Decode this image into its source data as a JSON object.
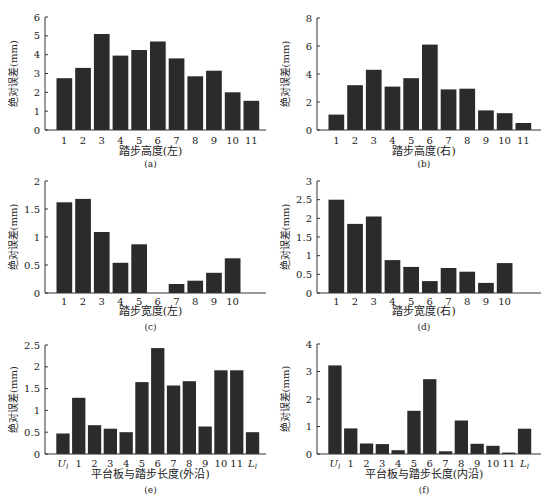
{
  "figure": {
    "ylabel": "绝对误差(mm)"
  },
  "chart_data": [
    {
      "id": "a",
      "type": "bar",
      "caption": "(a)",
      "xlabel": "踏步高度(左)",
      "ylabel": "绝对误差(mm)",
      "categories": [
        "1",
        "2",
        "3",
        "4",
        "5",
        "6",
        "7",
        "8",
        "9",
        "10",
        "11"
      ],
      "values": [
        2.75,
        3.3,
        5.1,
        3.95,
        4.25,
        4.7,
        3.8,
        2.85,
        3.15,
        2.0,
        1.55
      ],
      "ylim": [
        0,
        6
      ],
      "yticks": [
        0,
        1,
        2,
        3,
        4,
        5,
        6
      ],
      "grid": false
    },
    {
      "id": "b",
      "type": "bar",
      "caption": "(b)",
      "xlabel": "踏步高度(右)",
      "ylabel": "绝对误差(mm)",
      "categories": [
        "1",
        "2",
        "3",
        "4",
        "5",
        "6",
        "7",
        "8",
        "9",
        "10",
        "11"
      ],
      "values": [
        1.1,
        3.2,
        4.3,
        3.1,
        3.7,
        6.1,
        2.9,
        2.95,
        1.4,
        1.2,
        0.5
      ],
      "ylim": [
        0,
        8
      ],
      "yticks": [
        0,
        2,
        4,
        6,
        8
      ],
      "grid": false
    },
    {
      "id": "c",
      "type": "bar",
      "caption": "(c)",
      "xlabel": "踏步宽度(左)",
      "ylabel": "绝对误差(mm)",
      "categories": [
        "1",
        "2",
        "3",
        "4",
        "5",
        "6",
        "7",
        "8",
        "9",
        "10"
      ],
      "values": [
        1.62,
        1.68,
        1.09,
        0.54,
        0.87,
        0.0,
        0.16,
        0.22,
        0.36,
        0.62
      ],
      "ylim": [
        0,
        2
      ],
      "yticks": [
        0,
        0.5,
        1,
        1.5,
        2
      ],
      "grid": false
    },
    {
      "id": "d",
      "type": "bar",
      "caption": "(d)",
      "xlabel": "踏步宽度(右)",
      "ylabel": "绝对误差(mm)",
      "categories": [
        "1",
        "2",
        "3",
        "4",
        "5",
        "6",
        "7",
        "8",
        "9",
        "10"
      ],
      "values": [
        2.5,
        1.85,
        2.05,
        0.88,
        0.7,
        0.32,
        0.67,
        0.57,
        0.27,
        0.8
      ],
      "ylim": [
        0,
        3
      ],
      "yticks": [
        0,
        0.5,
        1,
        1.5,
        2,
        2.5,
        3
      ],
      "grid": false
    },
    {
      "id": "e",
      "type": "bar",
      "caption": "(e)",
      "xlabel": "平台板与踏步长度(外沿)",
      "ylabel": "绝对误差(mm)",
      "categories": [
        "Ul",
        "1",
        "2",
        "3",
        "4",
        "5",
        "6",
        "7",
        "8",
        "9",
        "10",
        "11",
        "Ll"
      ],
      "values": [
        0.47,
        1.29,
        0.66,
        0.58,
        0.5,
        1.65,
        2.43,
        1.57,
        1.67,
        0.63,
        1.92,
        1.92,
        0.5
      ],
      "ylim": [
        0,
        2.5
      ],
      "yticks": [
        0,
        0.5,
        1,
        1.5,
        2,
        2.5
      ],
      "grid": false
    },
    {
      "id": "f",
      "type": "bar",
      "caption": "(f)",
      "xlabel": "平台板与踏步长度(内沿)",
      "ylabel": "绝对误差(mm)",
      "categories": [
        "Ul",
        "1",
        "2",
        "3",
        "4",
        "5",
        "6",
        "7",
        "8",
        "9",
        "10",
        "11",
        "Ll"
      ],
      "values": [
        3.22,
        0.93,
        0.38,
        0.36,
        0.14,
        1.57,
        2.72,
        0.1,
        1.22,
        0.37,
        0.3,
        0.05,
        0.92
      ],
      "ylim": [
        0,
        4
      ],
      "yticks": [
        0,
        1,
        2,
        3,
        4
      ],
      "grid": false
    }
  ],
  "style": {
    "bar_color": "#2b2b2b",
    "axis_color": "#333333"
  }
}
